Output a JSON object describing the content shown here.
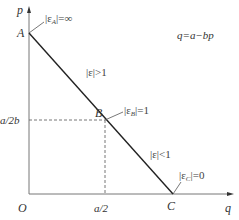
{
  "diagram": {
    "title_equation": "q=a−bp",
    "axes": {
      "y_label": "p",
      "x_label": "q",
      "origin_label": "O"
    },
    "points": [
      {
        "name": "A",
        "elasticity_label": "|ε",
        "sub": "A",
        "rel": "|=∞"
      },
      {
        "name": "B",
        "elasticity_label": "|ε",
        "sub": "B",
        "rel": "|=1"
      },
      {
        "name": "C",
        "elasticity_label": "|ε",
        "sub": "C",
        "rel": "|=0"
      }
    ],
    "regions": [
      {
        "label": "|ε|>1"
      },
      {
        "label": "|ε|<1"
      }
    ],
    "ticks": {
      "y_mid": "a/2b",
      "x_mid": "a/2"
    },
    "colors": {
      "line": "#222222",
      "axis": "#666666",
      "dash": "#666666"
    }
  }
}
